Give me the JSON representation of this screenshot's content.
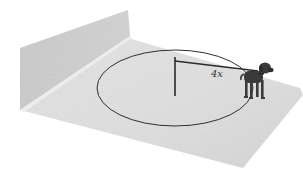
{
  "figure": {
    "leash_label": "4x"
  },
  "colors": {
    "background": "#ffffff",
    "floor": "#e4e4e4",
    "wall": "#c9c9c9",
    "wall_top": "#dcdcdc",
    "lines": "#2f2f2f",
    "dog": "#3a3a3a"
  }
}
